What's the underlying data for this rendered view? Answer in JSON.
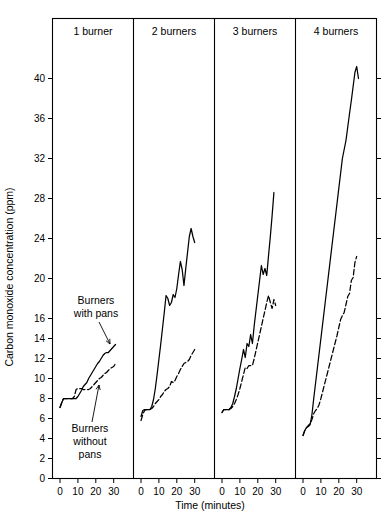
{
  "chart_data": {
    "type": "line",
    "title": "",
    "xlabel": "Time (minutes)",
    "ylabel": "Carbon monoxide concentration (ppm)",
    "xlim": [
      0,
      32
    ],
    "ylim": [
      0,
      42
    ],
    "grid": false,
    "legend_position": "inline-annotations",
    "x_tick_labels": [
      "0",
      "10",
      "20",
      "30"
    ],
    "y_tick_labels": [
      "0",
      "2",
      "4",
      "6",
      "8",
      "10",
      "12",
      "14",
      "16",
      "20",
      "24",
      "28",
      "32",
      "36",
      "40"
    ],
    "y_tick_values": [
      0,
      2,
      4,
      6,
      8,
      10,
      12,
      14,
      16,
      20,
      24,
      28,
      32,
      36,
      40
    ],
    "x_tick_values": [
      0,
      10,
      20,
      30
    ],
    "annotations": [
      {
        "name": "burners-with-pans",
        "text": "Burners with pans",
        "line1": "Burners",
        "line2": "with pans"
      },
      {
        "name": "burners-without-pans",
        "text": "Burners without pans",
        "line1": "Burners",
        "line2": "without",
        "line3": "pans"
      }
    ],
    "panels": [
      {
        "label": "1 burner",
        "series": [
          {
            "name": "Burners with pans",
            "style": "solid",
            "x": [
              0,
              1,
              2,
              3,
              5,
              7,
              8,
              9,
              10,
              11,
              12,
              13,
              14,
              15,
              16,
              17,
              18,
              19,
              20,
              21,
              22,
              23,
              24,
              25,
              26,
              27,
              28,
              29,
              30,
              31
            ],
            "y": [
              7.1,
              7.6,
              8.0,
              8.0,
              8.0,
              8.0,
              8.0,
              8.0,
              8.2,
              8.5,
              8.8,
              9.2,
              9.4,
              9.6,
              10.0,
              10.3,
              10.6,
              10.9,
              11.2,
              11.5,
              11.7,
              12.0,
              12.3,
              12.5,
              12.6,
              12.6,
              12.8,
              13.0,
              13.2,
              13.4
            ]
          },
          {
            "name": "Burners without pans",
            "style": "dashed",
            "x": [
              0,
              1,
              2,
              3,
              5,
              7,
              8,
              9,
              10,
              11,
              12,
              13,
              14,
              15,
              16,
              17,
              18,
              19,
              20,
              21,
              22,
              23,
              24,
              25,
              26,
              27,
              28,
              29,
              30,
              31
            ],
            "y": [
              7.1,
              7.6,
              8.0,
              8.0,
              8.0,
              8.0,
              8.2,
              8.9,
              9.0,
              9.0,
              9.0,
              8.9,
              8.9,
              8.9,
              8.9,
              9.0,
              9.2,
              9.4,
              9.6,
              9.8,
              10.0,
              10.1,
              10.3,
              10.5,
              10.6,
              10.8,
              11.0,
              11.1,
              11.2,
              11.5
            ]
          }
        ]
      },
      {
        "label": "2 burners",
        "series": [
          {
            "name": "Burners with pans",
            "style": "solid",
            "x": [
              0,
              1,
              2,
              3,
              4,
              5,
              6,
              7,
              8,
              9,
              10,
              11,
              12,
              13,
              14,
              15,
              16,
              17,
              18,
              19,
              20,
              21,
              22,
              23,
              24,
              25,
              26,
              27,
              28,
              29,
              30
            ],
            "y": [
              6.2,
              6.8,
              6.9,
              6.9,
              6.9,
              6.9,
              7.2,
              7.9,
              9.0,
              10.4,
              11.9,
              13.4,
              15.0,
              16.6,
              18.3,
              18.0,
              17.3,
              17.6,
              18.4,
              18.1,
              19.0,
              20.4,
              21.7,
              20.9,
              19.3,
              21.0,
              22.6,
              24.2,
              25.0,
              24.2,
              23.6
            ]
          },
          {
            "name": "Burners without pans",
            "style": "dashed",
            "x": [
              0,
              1,
              2,
              3,
              4,
              5,
              6,
              7,
              8,
              9,
              10,
              11,
              12,
              13,
              14,
              15,
              16,
              17,
              18,
              19,
              20,
              21,
              22,
              23,
              24,
              25,
              26,
              27,
              28,
              29,
              30
            ],
            "y": [
              5.8,
              6.4,
              6.8,
              6.9,
              6.9,
              6.9,
              7.0,
              7.2,
              7.5,
              7.7,
              7.9,
              8.2,
              8.4,
              8.7,
              8.9,
              9.0,
              9.2,
              9.7,
              9.6,
              9.8,
              10.2,
              10.5,
              10.9,
              11.2,
              11.5,
              11.6,
              11.7,
              11.9,
              12.3,
              12.6,
              12.9
            ]
          }
        ]
      },
      {
        "label": "3 burners",
        "series": [
          {
            "name": "Burners with pans",
            "style": "solid",
            "x": [
              0,
              1,
              2,
              3,
              4,
              5,
              6,
              7,
              8,
              9,
              10,
              11,
              12,
              13,
              14,
              15,
              16,
              17,
              18,
              19,
              20,
              21,
              22,
              23,
              24,
              25,
              26,
              27,
              28,
              29
            ],
            "y": [
              6.6,
              6.9,
              6.9,
              6.9,
              6.9,
              7.1,
              7.5,
              8.2,
              9.0,
              10.0,
              11.0,
              11.9,
              12.9,
              12.1,
              13.5,
              13.2,
              14.4,
              13.5,
              15.3,
              16.8,
              18.3,
              19.8,
              21.3,
              20.4,
              21.0,
              20.3,
              22.3,
              24.2,
              26.3,
              28.6
            ]
          },
          {
            "name": "Burners without pans",
            "style": "dashed",
            "x": [
              0,
              1,
              2,
              3,
              4,
              5,
              6,
              7,
              8,
              9,
              10,
              11,
              12,
              13,
              14,
              15,
              16,
              17,
              18,
              19,
              20,
              21,
              22,
              23,
              24,
              25,
              26,
              27,
              28,
              29,
              30
            ],
            "y": [
              6.6,
              6.9,
              6.9,
              6.9,
              6.9,
              7.0,
              7.2,
              7.5,
              7.9,
              8.4,
              9.0,
              9.7,
              10.4,
              11.1,
              11.0,
              11.3,
              11.3,
              11.3,
              12.0,
              12.8,
              13.6,
              14.4,
              15.2,
              16.0,
              16.8,
              17.6,
              18.3,
              17.6,
              17.0,
              17.9,
              17.3
            ]
          }
        ]
      },
      {
        "label": "4 burners",
        "series": [
          {
            "name": "Burners with pans",
            "style": "solid",
            "x": [
              0,
              1,
              2,
              3,
              4,
              5,
              6,
              7,
              8,
              9,
              10,
              12,
              14,
              16,
              18,
              20,
              22,
              24,
              26,
              27,
              28,
              29,
              30,
              31
            ],
            "y": [
              4.3,
              4.8,
              5.1,
              5.2,
              5.4,
              6.4,
              8.0,
              9.5,
              11.0,
              12.5,
              14.0,
              17.0,
              20.0,
              23.0,
              26.0,
              29.0,
              32.0,
              33.8,
              36.5,
              37.8,
              39.2,
              40.6,
              41.2,
              40.0
            ]
          },
          {
            "name": "Burners without pans",
            "style": "dashed",
            "x": [
              0,
              1,
              2,
              3,
              4,
              5,
              6,
              7,
              8,
              9,
              10,
              11,
              12,
              13,
              14,
              15,
              16,
              17,
              18,
              19,
              20,
              21,
              22,
              23,
              24,
              25,
              26,
              27,
              28,
              29,
              30
            ],
            "y": [
              4.3,
              4.8,
              5.1,
              5.3,
              5.5,
              5.9,
              6.5,
              6.8,
              7.0,
              7.4,
              8.0,
              8.7,
              9.4,
              10.1,
              10.8,
              11.5,
              12.2,
              12.9,
              13.6,
              14.3,
              15.1,
              15.9,
              16.3,
              16.6,
              17.4,
              18.2,
              18.5,
              19.8,
              20.1,
              21.6,
              22.2
            ]
          }
        ]
      }
    ]
  }
}
